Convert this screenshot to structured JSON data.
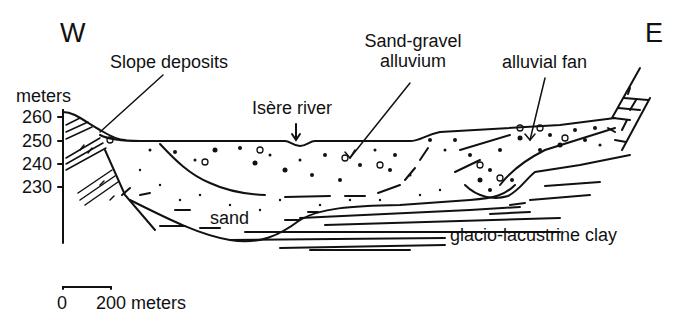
{
  "diagram": {
    "type": "geological cross-section",
    "orientation": {
      "west": "W",
      "east": "E"
    },
    "axis": {
      "unit_label": "meters",
      "ticks": [
        "260",
        "250",
        "240",
        "230"
      ]
    },
    "labels": {
      "slope_deposits": "Slope deposits",
      "sand_gravel_line1": "Sand-gravel",
      "sand_gravel_line2": "alluvium",
      "alluvial_fan": "alluvial fan",
      "isere_river": "Isère river",
      "sand": "sand",
      "clay": "glacio-lacustrine clay"
    },
    "scale_bar": {
      "start": "0",
      "end_label": "200 meters"
    },
    "colors": {
      "ink": "#111111",
      "background": "#ffffff"
    }
  }
}
